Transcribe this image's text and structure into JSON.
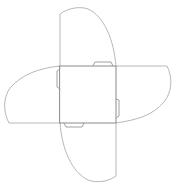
{
  "diagram": {
    "type": "furniture-plan",
    "colors": {
      "background": "#ffffff",
      "table_outline": "#8a8a8a",
      "leaf_outline": "#b8b8b8",
      "hinge_outline": "#a0a0a0"
    },
    "table_top": {
      "x": 60,
      "y": 66,
      "width": 56,
      "height": 57
    },
    "leaves": [
      {
        "id": "top",
        "extent": 8
      },
      {
        "id": "right",
        "extent": 170
      },
      {
        "id": "bottom",
        "extent": 181
      },
      {
        "id": "left",
        "extent": 4
      }
    ],
    "hinges": [
      "top",
      "right",
      "bottom",
      "left"
    ]
  }
}
